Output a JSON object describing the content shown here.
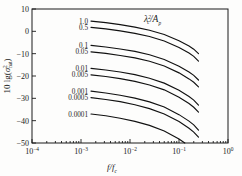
{
  "chart_data": {
    "type": "line",
    "title": "",
    "xlabel": "f/f_c",
    "ylabel": "10 lg(sigma^2_nat)",
    "xscale": "log",
    "xlim": [
      0.0001,
      1
    ],
    "ylim": [
      -50,
      10
    ],
    "grid": false,
    "legend_position": "inline-left-labels",
    "annotation": "lambda_c^2 / A_p",
    "xticklabels": [
      "10",
      "10",
      "10",
      "10",
      "10"
    ],
    "xtickexponents": [
      "-4",
      "-3",
      "-2",
      "-1",
      "0"
    ],
    "yticklabels": [
      "10",
      "0",
      "-10",
      "-20",
      "-30",
      "-40",
      "-50"
    ],
    "yticks": [
      10,
      0,
      -10,
      -20,
      -30,
      -40,
      -50
    ],
    "series": [
      {
        "name": "1.0",
        "label": "1.0",
        "x": [
          0.0016,
          0.0032,
          0.0063,
          0.0126,
          0.025,
          0.05,
          0.1,
          0.16,
          0.2,
          0.25
        ],
        "y": [
          4.6,
          3.9,
          3.0,
          1.9,
          0.5,
          -1.4,
          -4.2,
          -6.6,
          -8.0,
          -10.0
        ]
      },
      {
        "name": "0.5",
        "label": "0.5",
        "x": [
          0.0016,
          0.0032,
          0.0063,
          0.0126,
          0.025,
          0.05,
          0.1,
          0.16,
          0.2,
          0.25
        ],
        "y": [
          1.8,
          1.1,
          0.2,
          -0.9,
          -2.3,
          -4.3,
          -7.2,
          -9.7,
          -11.2,
          -13.3
        ]
      },
      {
        "name": "0.1",
        "label": "0.1",
        "x": [
          0.0016,
          0.0032,
          0.0063,
          0.0126,
          0.025,
          0.05,
          0.1,
          0.16,
          0.2,
          0.25
        ],
        "y": [
          -6.3,
          -7.0,
          -7.9,
          -9.0,
          -10.5,
          -12.6,
          -15.6,
          -18.2,
          -19.7,
          -21.8
        ]
      },
      {
        "name": "0.05",
        "label": "0.05",
        "x": [
          0.0016,
          0.0032,
          0.0063,
          0.0126,
          0.025,
          0.05,
          0.1,
          0.16,
          0.2,
          0.25
        ],
        "y": [
          -9.2,
          -9.9,
          -10.8,
          -11.9,
          -13.4,
          -15.5,
          -18.6,
          -21.3,
          -22.8,
          -24.9
        ]
      },
      {
        "name": "0.01",
        "label": "0.01",
        "x": [
          0.0016,
          0.0032,
          0.0063,
          0.0126,
          0.025,
          0.05,
          0.1,
          0.16,
          0.2,
          0.25
        ],
        "y": [
          -16.6,
          -17.3,
          -18.2,
          -19.4,
          -21.0,
          -23.2,
          -26.4,
          -29.2,
          -30.8,
          -33.0
        ]
      },
      {
        "name": "0.005",
        "label": "0.005",
        "x": [
          0.0016,
          0.0032,
          0.0063,
          0.0126,
          0.025,
          0.05,
          0.1,
          0.16,
          0.2,
          0.25
        ],
        "y": [
          -19.5,
          -20.2,
          -21.2,
          -22.4,
          -24.0,
          -26.2,
          -29.5,
          -32.3,
          -34.0,
          -36.2
        ]
      },
      {
        "name": "0.001",
        "label": "0.001",
        "x": [
          0.0016,
          0.0032,
          0.0063,
          0.0126,
          0.025,
          0.05,
          0.1,
          0.16,
          0.2,
          0.25
        ],
        "y": [
          -26.8,
          -27.6,
          -28.6,
          -29.9,
          -31.6,
          -33.9,
          -37.3,
          -40.2,
          -41.9,
          -44.2
        ]
      },
      {
        "name": "0.0005",
        "label": "0.0005",
        "x": [
          0.0016,
          0.0032,
          0.0063,
          0.0126,
          0.025,
          0.05,
          0.1,
          0.16,
          0.2,
          0.25
        ],
        "y": [
          -29.7,
          -30.5,
          -31.5,
          -32.9,
          -34.6,
          -37.0,
          -40.4,
          -43.4,
          -45.1,
          -47.4
        ]
      },
      {
        "name": "0.0001",
        "label": "0.0001",
        "x": [
          0.0016,
          0.0032,
          0.0063,
          0.0126,
          0.025,
          0.05,
          0.1,
          0.16,
          0.2,
          0.25
        ],
        "y": [
          -37.0,
          -37.8,
          -38.9,
          -40.3,
          -42.1,
          -44.6,
          -48.2,
          -51.3,
          -53.1,
          -55.6
        ]
      }
    ]
  },
  "axes": {
    "x_label_numerator": "f",
    "x_label_denominator": "f",
    "x_label_denominator_sub": "c",
    "y_label_prefix": "10 lg(",
    "y_label_symbol": "σ",
    "y_label_sup": "2",
    "y_label_sub": "nat",
    "y_label_suffix": ")"
  },
  "annotation": {
    "symbol": "λ",
    "sup": "2",
    "sub": "c",
    "slash": "/",
    "denom": "A",
    "denom_sub": "p"
  }
}
